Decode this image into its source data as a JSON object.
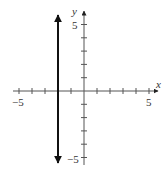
{
  "chart_data": {
    "type": "line",
    "title": "",
    "xlabel": "x",
    "ylabel": "y",
    "xlim": [
      -5.5,
      5.5
    ],
    "ylim": [
      -5.5,
      5.5
    ],
    "x_tick_labels": [
      "-5",
      "5"
    ],
    "y_tick_labels": [
      "5",
      "-5"
    ],
    "x_ticks": [
      -5,
      -4,
      -3,
      -2,
      -1,
      1,
      2,
      3,
      4,
      5
    ],
    "y_ticks": [
      -5,
      -4,
      -3,
      -2,
      -1,
      1,
      2,
      3,
      4,
      5
    ],
    "grid": false,
    "series": [
      {
        "name": "x = -2",
        "equation": "x = -2",
        "x": [
          -2,
          -2
        ],
        "y": [
          -5.5,
          5.5
        ],
        "arrows": "both",
        "color": "#111111"
      }
    ]
  },
  "labels": {
    "x_axis": "x",
    "y_axis": "y",
    "x_neg": "−5",
    "x_pos": "5",
    "y_pos": "5",
    "y_neg": "−5"
  }
}
